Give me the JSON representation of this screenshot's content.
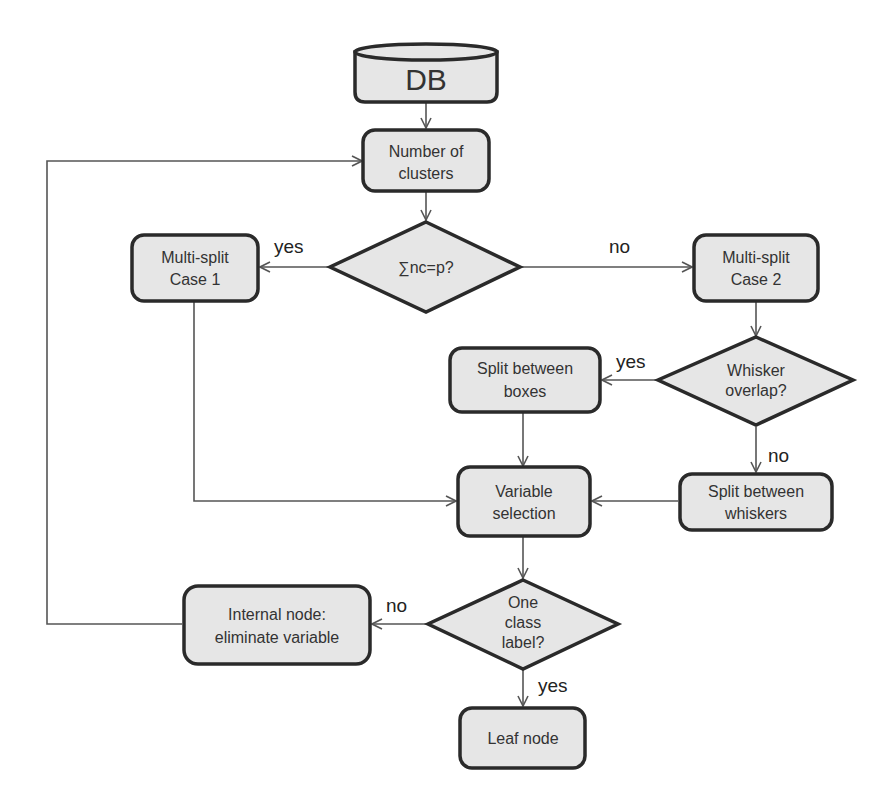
{
  "diagram": {
    "type": "flowchart",
    "nodes": {
      "db": {
        "label": "DB",
        "shape": "cylinder"
      },
      "num_clusters": {
        "line1": "Number of",
        "line2": "clusters",
        "shape": "rounded-rect"
      },
      "cond_sum": {
        "label": "∑nc=p?",
        "shape": "diamond"
      },
      "multi1": {
        "line1": "Multi-split",
        "line2": "Case 1",
        "shape": "rounded-rect"
      },
      "multi2": {
        "line1": "Multi-split",
        "line2": "Case 2",
        "shape": "rounded-rect"
      },
      "cond_whisker": {
        "line1": "Whisker",
        "line2": "overlap?",
        "shape": "diamond"
      },
      "split_boxes": {
        "line1": "Split between",
        "line2": "boxes",
        "shape": "rounded-rect"
      },
      "split_whiskers": {
        "line1": "Split between",
        "line2": "whiskers",
        "shape": "rounded-rect"
      },
      "var_sel": {
        "line1": "Variable",
        "line2": "selection",
        "shape": "rounded-rect"
      },
      "cond_class": {
        "line1": "One",
        "line2": "class",
        "line3": "label?",
        "shape": "diamond"
      },
      "internal": {
        "line1": "Internal  node:",
        "line2": "eliminate variable",
        "shape": "rounded-rect"
      },
      "leaf": {
        "label": "Leaf node",
        "shape": "rounded-rect"
      }
    },
    "edge_labels": {
      "sum_yes": "yes",
      "sum_no": "no",
      "whisker_yes": "yes",
      "whisker_no": "no",
      "class_no": "no",
      "class_yes": "yes"
    },
    "colors": {
      "node_fill": "#e6e6e6",
      "node_stroke": "#2a2a2a",
      "edge": "#555555"
    }
  }
}
